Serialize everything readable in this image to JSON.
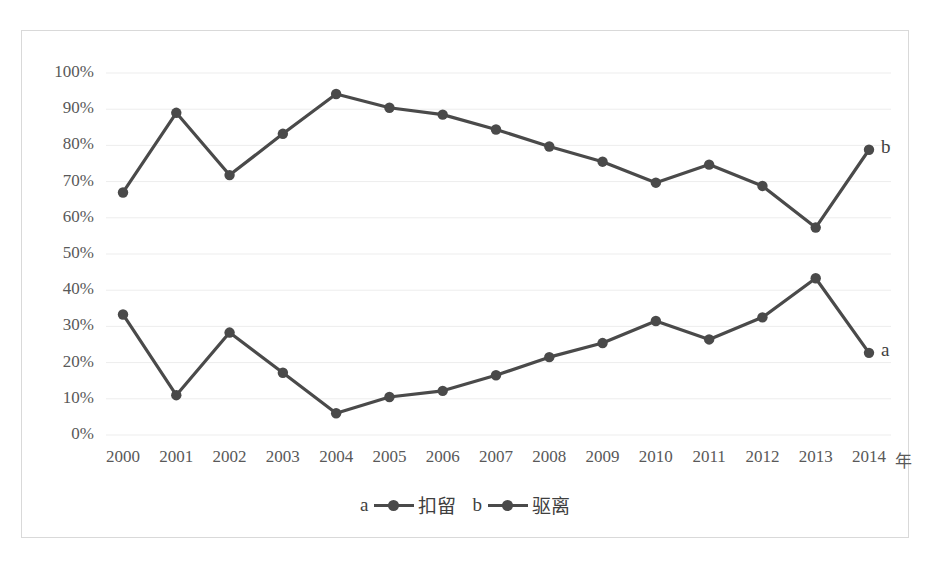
{
  "chart_data": {
    "type": "line",
    "title": "",
    "xlabel": "年",
    "ylabel": "",
    "categories": [
      "2000",
      "2001",
      "2002",
      "2003",
      "2004",
      "2005",
      "2006",
      "2007",
      "2008",
      "2009",
      "2010",
      "2011",
      "2012",
      "2013",
      "2014"
    ],
    "ylim": [
      0,
      100
    ],
    "yticks": [
      "0%",
      "10%",
      "20%",
      "30%",
      "40%",
      "50%",
      "60%",
      "70%",
      "80%",
      "90%",
      "100%"
    ],
    "ytick_values": [
      0,
      10,
      20,
      30,
      40,
      50,
      60,
      70,
      80,
      90,
      100
    ],
    "grid": true,
    "legend_position": "bottom",
    "series": [
      {
        "key": "a",
        "name": "扣留",
        "end_label": "a",
        "color": "#4a4a4a",
        "values": [
          33.3,
          11.0,
          28.3,
          17.2,
          6.0,
          10.5,
          12.2,
          16.5,
          21.5,
          25.4,
          31.5,
          26.4,
          32.5,
          43.3,
          22.7
        ]
      },
      {
        "key": "b",
        "name": "驱离",
        "end_label": "b",
        "color": "#4a4a4a",
        "values": [
          67.0,
          89.0,
          71.8,
          83.2,
          94.2,
          90.4,
          88.5,
          84.4,
          79.7,
          75.5,
          69.7,
          74.7,
          68.8,
          57.3,
          78.8
        ]
      }
    ]
  },
  "legend": {
    "entries": [
      {
        "key": "a",
        "label": "扣留"
      },
      {
        "key": "b",
        "label": "驱离"
      }
    ]
  },
  "axis": {
    "x_unit": "年"
  }
}
